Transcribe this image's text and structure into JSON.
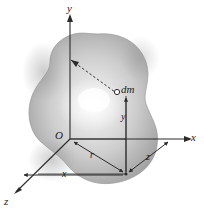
{
  "figure": {
    "background_color": "#ffffff",
    "line_color": "#2b2b2b",
    "body": {
      "name": "irregular-blob-body",
      "fill_light": "#ededed",
      "fill_mid": "#c9c9c9",
      "fill_dark": "#a6a6a6",
      "edge_color": "#9a9a9a"
    },
    "axes": [
      {
        "id": "y-axis",
        "label": "y",
        "direction": "up",
        "label_x": 69,
        "label_y": 5
      },
      {
        "id": "x-axis",
        "label": "x",
        "direction": "right",
        "label_x": 192,
        "label_y": 139
      },
      {
        "id": "z-axis",
        "label": "z",
        "direction": "down-left",
        "label_x": 6,
        "label_y": 197
      }
    ],
    "origin": {
      "label": "O",
      "x": 57,
      "y": 132
    },
    "mass_element": {
      "label": "dm",
      "marker": "open-circle",
      "label_x": 121,
      "label_y": 88,
      "point_x": 117,
      "point_y": 93
    },
    "dimensions": [
      {
        "id": "radius-r",
        "label": "r",
        "label_x": 90,
        "label_y": 155
      },
      {
        "id": "x-distance",
        "label": "x",
        "label_x": 62,
        "label_y": 177
      },
      {
        "id": "y-distance",
        "label": "y",
        "label_x": 120,
        "label_y": 117
      },
      {
        "id": "z-distance",
        "label": "z",
        "label_x": 147,
        "label_y": 157
      }
    ],
    "dashed_line": {
      "id": "radial-dashed-line",
      "description": "dashed line from y-axis to dm"
    },
    "watermark": {
      "text": "",
      "x": 146,
      "y": 20
    }
  }
}
